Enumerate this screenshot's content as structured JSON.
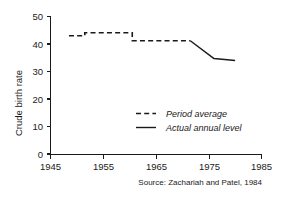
{
  "chart_data": {
    "type": "line",
    "title": "",
    "xlabel": "",
    "ylabel": "Crude birth rate",
    "xlim": [
      1945,
      1985
    ],
    "ylim": [
      0,
      50
    ],
    "xticks": [
      "1945",
      "1955",
      "1965",
      "1975",
      "1985"
    ],
    "xtick_values": [
      1945,
      1955,
      1965,
      1975,
      1985
    ],
    "yticks": [
      "0",
      "10",
      "20",
      "30",
      "40",
      "50"
    ],
    "ytick_values": [
      0,
      10,
      20,
      30,
      40,
      50
    ],
    "grid": false,
    "legend_position": "center-right",
    "series": [
      {
        "name": "Period average",
        "style": "dashed",
        "color": "#1a1a1a",
        "points": [
          {
            "x": 1948.5,
            "y": 43.0
          },
          {
            "x": 1951.5,
            "y": 43.0
          },
          {
            "x": 1951.5,
            "y": 44.1
          },
          {
            "x": 1960.5,
            "y": 44.1
          },
          {
            "x": 1960.5,
            "y": 41.2
          },
          {
            "x": 1971.5,
            "y": 41.2
          }
        ]
      },
      {
        "name": "Actual annual level",
        "style": "solid",
        "color": "#1a1a1a",
        "points": [
          {
            "x": 1971.5,
            "y": 41.2
          },
          {
            "x": 1976.0,
            "y": 34.7
          },
          {
            "x": 1980.0,
            "y": 34.0
          }
        ]
      }
    ],
    "annotations": [
      {
        "name": "source-note",
        "text": "Source: Zachariah and Patel, 1984"
      }
    ]
  },
  "legend": {
    "items": [
      {
        "label": "Period average",
        "style": "dashed"
      },
      {
        "label": "Actual annual level",
        "style": "solid"
      }
    ]
  },
  "axis": {
    "y_title": "Crude birth rate"
  },
  "source": {
    "note": "Source: Zachariah and Patel, 1984"
  }
}
